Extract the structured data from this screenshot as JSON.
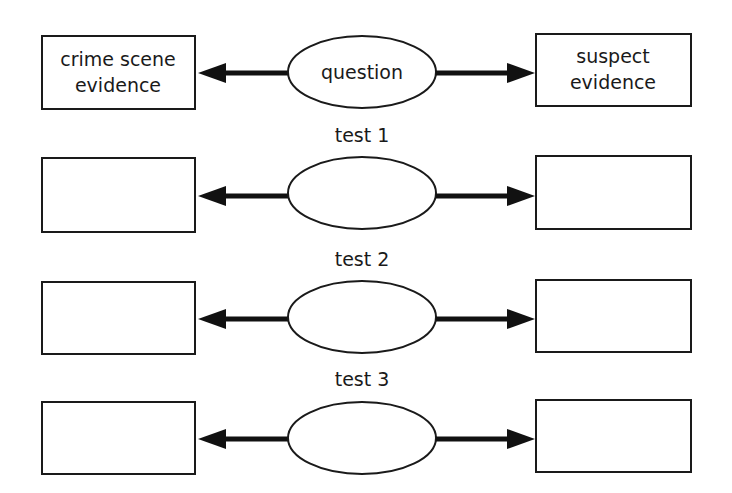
{
  "diagram": {
    "rows": [
      {
        "label": "",
        "center": "question",
        "left_lines": [
          "crime scene",
          "evidence"
        ],
        "right_lines": [
          "suspect",
          "evidence"
        ]
      },
      {
        "label": "test 1",
        "center": "",
        "left_lines": [
          "",
          ""
        ],
        "right_lines": [
          "",
          ""
        ]
      },
      {
        "label": "test 2",
        "center": "",
        "left_lines": [
          "",
          ""
        ],
        "right_lines": [
          "",
          ""
        ]
      },
      {
        "label": "test 3",
        "center": "",
        "left_lines": [
          "",
          ""
        ],
        "right_lines": [
          "",
          ""
        ]
      }
    ],
    "colors": {
      "stroke": "#1a1a1a",
      "arrow": "#111111",
      "background": "#ffffff"
    }
  }
}
